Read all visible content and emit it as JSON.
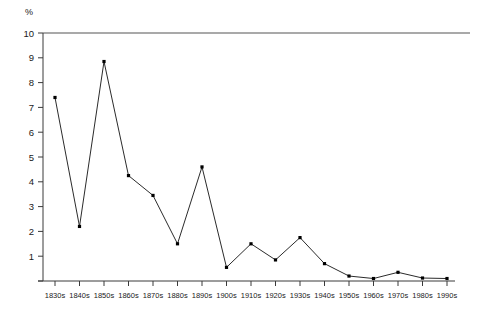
{
  "chart_data": {
    "type": "line",
    "title": "",
    "xlabel": "",
    "ylabel": "%",
    "categories": [
      "1830s",
      "1840s",
      "1850s",
      "1860s",
      "1870s",
      "1880s",
      "1890s",
      "1900s",
      "1910s",
      "1920s",
      "1930s",
      "1940s",
      "1950s",
      "1960s",
      "1970s",
      "1980s",
      "1990s"
    ],
    "values": [
      7.4,
      2.2,
      8.85,
      4.25,
      3.45,
      1.5,
      4.6,
      0.55,
      1.5,
      0.85,
      1.75,
      0.7,
      0.2,
      0.1,
      0.35,
      0.12,
      0.1
    ],
    "ylim": [
      0,
      10
    ],
    "ytick_labels": [
      "10",
      "9",
      "8",
      "7",
      "6",
      "5",
      "4",
      "3",
      "2",
      "1"
    ],
    "ytick_values": [
      10,
      9,
      8,
      7,
      6,
      5,
      4,
      3,
      2,
      1
    ],
    "grid": false,
    "legend": "none",
    "marker": "square",
    "line_color": "#2b2b2b",
    "marker_color": "#000000",
    "axis_color": "#3a3a3a",
    "top_border_color": "#8c8c8c",
    "background": "#ffffff"
  },
  "axis": {
    "y_unit": "%"
  }
}
